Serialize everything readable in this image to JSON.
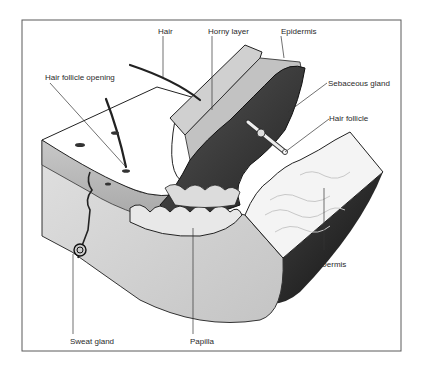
{
  "diagram": {
    "labels": {
      "hair": "Hair",
      "horny_layer": "Horny layer",
      "epidermis": "Epidermis",
      "hair_follicle_opening": "Hair follicle opening",
      "sebaceous_gland": "Sebaceous gland",
      "hair_follicle": "Hair follicle",
      "dermis": "Dermis",
      "sweat_gland": "Sweat gland",
      "papilla": "Papilla"
    },
    "colors": {
      "frame": "#555555",
      "surface": "#ffffff",
      "epidermis_side": "#b8b8b8",
      "dark_layer": "#3c3c3c",
      "dermis_cut": "#d6d6d6",
      "dermis_white": "#f2f2f2",
      "outline": "#1e1e1e"
    }
  }
}
